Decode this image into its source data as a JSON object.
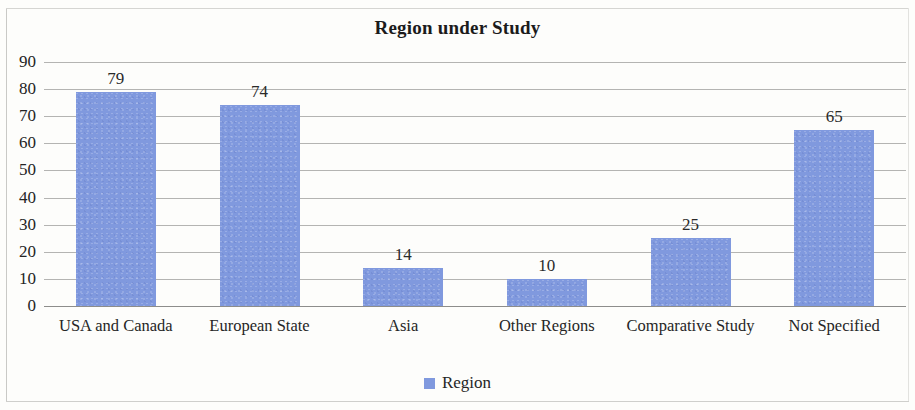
{
  "chart_data": {
    "type": "bar",
    "title": "Region under Study",
    "xlabel": "",
    "ylabel": "",
    "categories": [
      "USA and Canada",
      "European State",
      "Asia",
      "Other Regions",
      "Comparative Study",
      "Not Specified"
    ],
    "values": [
      79,
      74,
      14,
      10,
      25,
      65
    ],
    "series": [
      {
        "name": "Region",
        "values": [
          79,
          74,
          14,
          10,
          25,
          65
        ]
      }
    ],
    "ylim": [
      0,
      90
    ],
    "ytick_labels": [
      "90",
      "80",
      "70",
      "60",
      "50",
      "40",
      "30",
      "20",
      "10",
      "0"
    ],
    "ytick_values": [
      90,
      80,
      70,
      60,
      50,
      40,
      30,
      20,
      10,
      0
    ],
    "grid": true,
    "data_labels": [
      "79",
      "74",
      "14",
      "10",
      "25",
      "65"
    ],
    "legend": {
      "position": "bottom",
      "entries": [
        "Region"
      ]
    },
    "colors": {
      "bar": "#8099de",
      "gridline": "#b4b4b2",
      "axis": "#8d8d8b",
      "text": "#242424",
      "background": "#fdfdfb"
    }
  }
}
